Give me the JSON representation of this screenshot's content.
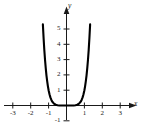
{
  "figure": {
    "kind": "cartesian-plot",
    "background_color": "#ffffff",
    "curve_color": "#000000",
    "axis_color": "#1a1a1a"
  },
  "chart_data": {
    "type": "line",
    "title": "",
    "subtitle": "",
    "xlabel": "x",
    "ylabel": "y",
    "grid": false,
    "legend": null,
    "xlim": [
      -3.6,
      3.9
    ],
    "ylim": [
      -1.35,
      5.9
    ],
    "xticks": [
      -3,
      -2,
      -1,
      1,
      2,
      3
    ],
    "yticks": [
      -1,
      1,
      2,
      3,
      4,
      5
    ],
    "xtick_labels": [
      "-3",
      "-2",
      "-1",
      "1",
      "2",
      "3"
    ],
    "ytick_labels": [
      "-1",
      "1",
      "2",
      "3",
      "4",
      "5"
    ],
    "series": [
      {
        "name": "even-power curve",
        "equation": "y = x^6",
        "x": [
          -1.32,
          -1.28,
          -1.24,
          -1.2,
          -1.16,
          -1.12,
          -1.08,
          -1.04,
          -1.0,
          -0.95,
          -0.9,
          -0.85,
          -0.8,
          -0.7,
          -0.6,
          -0.5,
          -0.4,
          -0.3,
          -0.2,
          -0.1,
          0.0,
          0.1,
          0.2,
          0.3,
          0.4,
          0.5,
          0.6,
          0.7,
          0.8,
          0.85,
          0.9,
          0.95,
          1.0,
          1.04,
          1.08,
          1.12,
          1.16,
          1.2,
          1.24,
          1.28,
          1.32
        ],
        "y": [
          5.3,
          4.41,
          3.64,
          2.99,
          2.44,
          1.97,
          1.59,
          1.27,
          1.0,
          0.74,
          0.53,
          0.38,
          0.26,
          0.12,
          0.05,
          0.02,
          0.0,
          0.0,
          0.0,
          0.0,
          0.0,
          0.0,
          0.0,
          0.0,
          0.0,
          0.02,
          0.05,
          0.12,
          0.26,
          0.38,
          0.53,
          0.74,
          1.0,
          1.27,
          1.59,
          1.97,
          2.44,
          2.99,
          3.64,
          4.41,
          5.3
        ]
      }
    ],
    "annotations": []
  },
  "axes": {
    "x_axis_label": "x",
    "y_axis_label": "y"
  }
}
